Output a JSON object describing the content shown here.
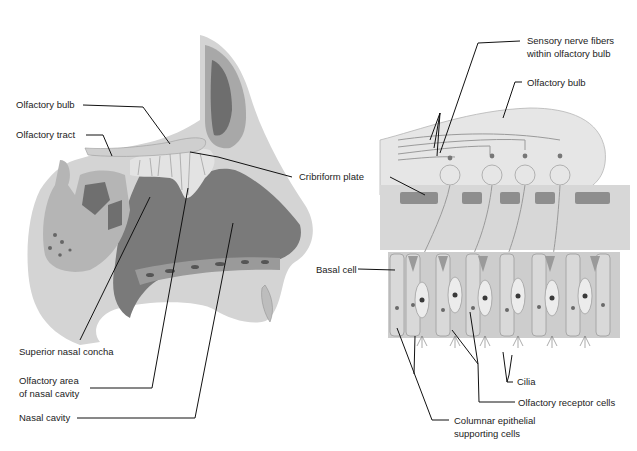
{
  "figure": {
    "left_panel": {
      "title": "Sagittal section of nasal cavity",
      "labels": {
        "olfactory_bulb": "Olfactory bulb",
        "olfactory_tract": "Olfactory tract",
        "cribriform_plate": "Cribriform plate",
        "superior_nasal_concha": "Superior nasal concha",
        "olfactory_area_line1": "Olfactory area",
        "olfactory_area_line2": "of nasal cavity",
        "nasal_cavity": "Nasal cavity"
      }
    },
    "right_panel": {
      "title": "Olfactory epithelium detail",
      "labels": {
        "sensory_fibers_line1": "Sensory nerve fibers",
        "sensory_fibers_line2": "within olfactory bulb",
        "olfactory_bulb": "Olfactory bulb",
        "basal_cell": "Basal cell",
        "cilia": "Cilia",
        "olfactory_receptor_cells": "Olfactory receptor cells",
        "columnar_line1": "Columnar epithelial",
        "columnar_line2": "supporting cells"
      }
    },
    "colors": {
      "tissue_light": "#d9d9d9",
      "tissue_mid": "#a9a9a9",
      "cavity_dark": "#7d7d7d",
      "bone": "#8a8a8a",
      "leader_line": "#111111"
    }
  }
}
